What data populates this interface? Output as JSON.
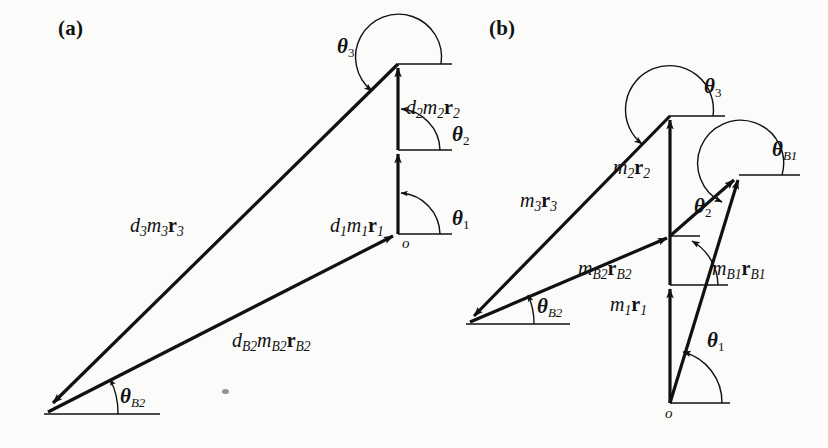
{
  "figure": {
    "type": "vector-polygon-diagram",
    "background_color": "#fbfbf9",
    "ink_color": "#111111",
    "panels": [
      {
        "id": "a",
        "label": "(a)",
        "origin_label": "o",
        "vectors": [
          {
            "name": "d1m1r1",
            "label_html": "d<sub>1</sub>m<sub>1</sub><b>r</b><sub>1</sub>",
            "direction": "up",
            "angle_label": "theta1"
          },
          {
            "name": "d2m2r2",
            "label_html": "d<sub>2</sub>m<sub>2</sub><b>r</b><sub>2</sub>",
            "direction": "up",
            "angle_label": "theta2"
          },
          {
            "name": "d3m3r3",
            "label_html": "d<sub>3</sub>m<sub>3</sub><b>r</b><sub>3</sub>",
            "direction": "down-left",
            "angle_label": "theta3"
          },
          {
            "name": "dB2mB2rB2",
            "label_html": "d<sub>B2</sub>m<sub>B2</sub><b>r</b><sub>B2</sub>",
            "direction": "up-right",
            "angle_label": "thetaB2"
          }
        ],
        "angles": [
          "theta1",
          "theta2",
          "theta3",
          "thetaB2"
        ]
      },
      {
        "id": "b",
        "label": "(b)",
        "origin_label": "o",
        "vectors": [
          {
            "name": "m1r1",
            "label_html": "m<sub>1</sub><b>r</b><sub>1</sub>",
            "direction": "up",
            "angle_label": "theta1"
          },
          {
            "name": "m2r2",
            "label_html": "m<sub>2</sub><b>r</b><sub>2</sub>",
            "direction": "up",
            "angle_label": "theta2"
          },
          {
            "name": "m3r3",
            "label_html": "m<sub>3</sub><b>r</b><sub>3</sub>",
            "direction": "down-left",
            "angle_label": "theta3"
          },
          {
            "name": "mB1rB1",
            "label_html": "m<sub>B1</sub><b>r</b><sub>B1</sub>",
            "direction": "up-right",
            "angle_label": "thetaB1"
          },
          {
            "name": "mB2rB2",
            "label_html": "m<sub>B2</sub><b>r</b><sub>B2</sub>",
            "direction": "up-right",
            "angle_label": "thetaB2"
          }
        ],
        "angles": [
          "theta1",
          "theta2",
          "theta3",
          "thetaB1",
          "thetaB2"
        ]
      }
    ]
  },
  "labels": {
    "panel_a": "(a)",
    "panel_b": "(b)",
    "origin": "o",
    "theta": "θ",
    "sub_1": "1",
    "sub_2": "2",
    "sub_3": "3",
    "sub_B1": "B1",
    "sub_B2": "B2",
    "a_d1m1r1": "d1m1r1",
    "a_d2m2r2": "d2m2r2",
    "a_d3m3r3": "d3m3r3",
    "a_dB2mB2rB2": "dB2mB2rB2",
    "b_m1r1": "m1r1",
    "b_m2r2": "m2r2",
    "b_m3r3": "m3r3",
    "b_mB1rB1": "mB1rB1",
    "b_mB2rB2": "mB2rB2"
  }
}
